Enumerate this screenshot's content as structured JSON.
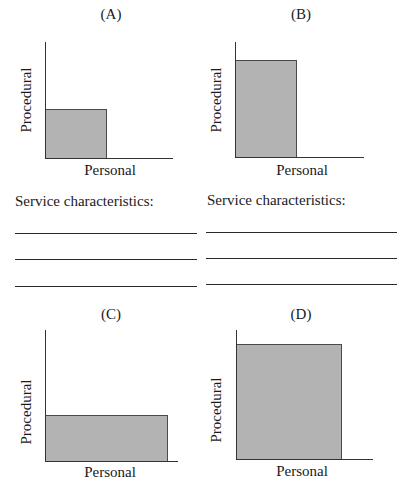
{
  "colors": {
    "fill": "#b3b3b3",
    "axis": "#333333",
    "bar_border": "#4a4a4a",
    "text": "#1a1a1a"
  },
  "panels": [
    {
      "id": "A",
      "title": "(A)",
      "y_label": "Procedural",
      "x_label": "Personal",
      "procedural_level": "low",
      "personal_level": "low"
    },
    {
      "id": "B",
      "title": "(B)",
      "y_label": "Procedural",
      "x_label": "Personal",
      "procedural_level": "high",
      "personal_level": "low"
    },
    {
      "id": "C",
      "title": "(C)",
      "y_label": "Procedural",
      "x_label": "Personal",
      "procedural_level": "low",
      "personal_level": "high"
    },
    {
      "id": "D",
      "title": "(D)",
      "y_label": "Procedural",
      "x_label": "Personal",
      "procedural_level": "high",
      "personal_level": "high"
    }
  ],
  "worksheet": {
    "left_heading": "Service characteristics:",
    "right_heading": "Service characteristics:",
    "lines_per_column": 3
  }
}
